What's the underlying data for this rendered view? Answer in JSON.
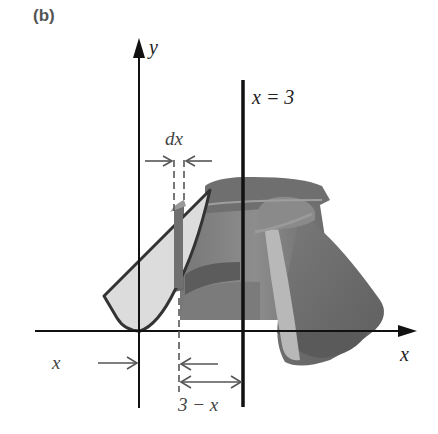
{
  "figure": {
    "panel_label": "(b)",
    "labels": {
      "y_axis": "y",
      "x_axis": "x",
      "line": "x = 3",
      "width": "dx",
      "x_distance": "x",
      "radius": "3 − x"
    },
    "colors": {
      "axis": "#111111",
      "solid_dark": "#6a6a6a",
      "solid_mid": "#8a8a8a",
      "solid_light": "#b5b5b5",
      "region_fill": "#d9d9d9",
      "region_outline": "#333333",
      "annotation": "#555555"
    }
  }
}
